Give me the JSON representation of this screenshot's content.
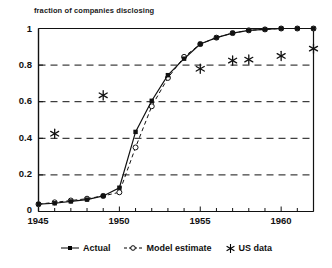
{
  "figure": {
    "axis_title": "fraction of companies disclosing"
  },
  "legend": {
    "items": [
      {
        "label": "Actual",
        "marker": "filled-square",
        "line": "solid"
      },
      {
        "label": "Model estimate",
        "marker": "open-circle",
        "line": "dashed"
      },
      {
        "label": "US data",
        "marker": "asterisk",
        "line": "none"
      }
    ]
  },
  "axes": {
    "y_ticks": [
      "0",
      "0.2",
      "0.4",
      "0.6",
      "0.8",
      "1"
    ],
    "x_ticks": [
      "1945",
      "1950",
      "1955",
      "1960"
    ]
  },
  "chart_data": {
    "type": "line",
    "title": "fraction of companies disclosing",
    "xlabel": "",
    "ylabel": "fraction of companies disclosing",
    "xlim": [
      1945,
      1962
    ],
    "ylim": [
      0,
      1
    ],
    "grid": "horizontal-dashed",
    "legend_position": "bottom-center",
    "x": [
      1945,
      1946,
      1947,
      1948,
      1949,
      1950,
      1951,
      1952,
      1953,
      1954,
      1955,
      1956,
      1957,
      1958,
      1959,
      1960,
      1961,
      1962
    ],
    "series": [
      {
        "name": "Actual",
        "marker": "filled-square",
        "line": "solid",
        "values": [
          0.04,
          0.045,
          0.055,
          0.065,
          0.085,
          0.13,
          0.435,
          0.605,
          0.745,
          0.835,
          0.915,
          0.95,
          0.975,
          0.99,
          0.995,
          1.0,
          1.0,
          1.0
        ]
      },
      {
        "name": "Model estimate",
        "marker": "open-circle",
        "line": "dashed",
        "values": [
          0.04,
          0.05,
          0.06,
          0.07,
          0.085,
          0.105,
          0.35,
          0.575,
          0.73,
          0.845,
          0.915,
          0.95,
          0.975,
          0.99,
          0.995,
          1.0,
          1.0,
          1.0
        ]
      },
      {
        "name": "US data",
        "marker": "asterisk",
        "line": "none",
        "points": [
          {
            "x": 1946,
            "y": 0.425
          },
          {
            "x": 1949,
            "y": 0.635
          },
          {
            "x": 1955,
            "y": 0.78
          },
          {
            "x": 1957,
            "y": 0.825
          },
          {
            "x": 1958,
            "y": 0.83
          },
          {
            "x": 1960,
            "y": 0.85
          },
          {
            "x": 1962,
            "y": 0.89
          }
        ]
      }
    ]
  }
}
